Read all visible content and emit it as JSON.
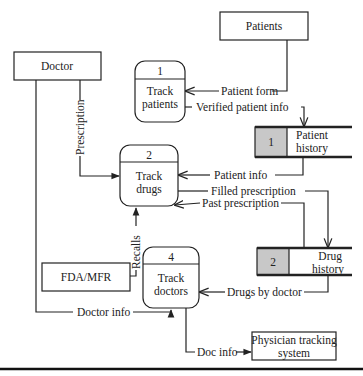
{
  "diagram": {
    "type": "data-flow-diagram",
    "external_entities": [
      {
        "id": "doctor",
        "label": "Doctor"
      },
      {
        "id": "patients",
        "label": "Patients"
      },
      {
        "id": "fda",
        "label": "FDA/MFR"
      },
      {
        "id": "physician",
        "label_line1": "Physician tracking",
        "label_line2": "system"
      }
    ],
    "processes": [
      {
        "id": "p1",
        "number": "1",
        "line1": "Track",
        "line2": "patients"
      },
      {
        "id": "p2",
        "number": "2",
        "line1": "Track",
        "line2": "drugs"
      },
      {
        "id": "p4",
        "number": "4",
        "line1": "Track",
        "line2": "doctors"
      }
    ],
    "data_stores": [
      {
        "id": "d1",
        "number": "1",
        "line1": "Patient",
        "line2": "history"
      },
      {
        "id": "d2",
        "number": "2",
        "line1": "Drug",
        "line2": "history"
      }
    ],
    "flows": [
      {
        "id": "patient_form",
        "label": "Patient form",
        "from": "Patients",
        "to": "Track patients"
      },
      {
        "id": "verified_patient_info",
        "label": "Verified patient info",
        "from": "Track patients",
        "to": "Patient history"
      },
      {
        "id": "prescription",
        "label": "Prescription",
        "from": "Doctor",
        "to": "Track drugs"
      },
      {
        "id": "patient_info",
        "label": "Patient info",
        "from": "Patient history",
        "to": "Track drugs"
      },
      {
        "id": "filled_prescription",
        "label": "Filled prescription",
        "from": "Track drugs",
        "to": "Drug history"
      },
      {
        "id": "past_prescription",
        "label": "Past prescription",
        "from": "Drug history",
        "to": "Track drugs"
      },
      {
        "id": "recalls",
        "label": "Recalls",
        "from": "FDA/MFR",
        "to": "Track drugs"
      },
      {
        "id": "drugs_by_doctor",
        "label": "Drugs by doctor",
        "from": "Drug history",
        "to": "Track doctors"
      },
      {
        "id": "doctor_info",
        "label": "Doctor info",
        "from": "Doctor",
        "to": "Track doctors"
      },
      {
        "id": "doc_info",
        "label": "Doc info",
        "from": "Track doctors",
        "to": "Physician tracking system"
      }
    ],
    "colors": {
      "store_fill": "#c8c8c8",
      "line": "#222222"
    }
  }
}
